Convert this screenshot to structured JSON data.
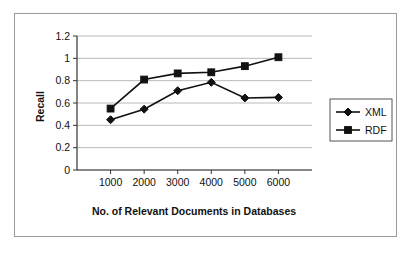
{
  "chart_data": {
    "type": "line",
    "title": "",
    "xlabel": "No. of Relevant Documents in Databases",
    "ylabel": "Recall",
    "categories": [
      1000,
      2000,
      3000,
      4000,
      5000,
      6000
    ],
    "xtick_labels": [
      "1000",
      "2000",
      "3000",
      "4000",
      "5000",
      "6000"
    ],
    "ytick_labels": [
      "0",
      "0.2",
      "0.4",
      "0.6",
      "0.8",
      "1",
      "1.2"
    ],
    "ytick_values": [
      0,
      0.2,
      0.4,
      0.6,
      0.8,
      1,
      1.2
    ],
    "ylim": [
      0,
      1.2
    ],
    "grid": "horizontal",
    "legend_position": "right",
    "series": [
      {
        "name": "XML",
        "marker": "diamond",
        "color": "#111111",
        "values": [
          0.45,
          0.545,
          0.71,
          0.785,
          0.645,
          0.65
        ]
      },
      {
        "name": "RDF",
        "marker": "square",
        "color": "#111111",
        "values": [
          0.55,
          0.81,
          0.865,
          0.875,
          0.93,
          1.01
        ]
      }
    ]
  },
  "legend": {
    "items": [
      {
        "label": "XML",
        "marker": "diamond"
      },
      {
        "label": "RDF",
        "marker": "square"
      }
    ]
  },
  "colors": {
    "series": "#111111",
    "gridline": "#b9b9b9",
    "axis": "#333333",
    "frame": "#9a9a9a",
    "background": "#ffffff"
  }
}
